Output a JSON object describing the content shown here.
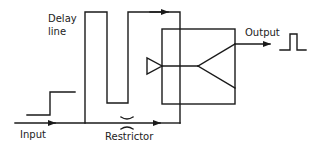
{
  "diagram": {
    "labels": {
      "delay_line_1": "Delay",
      "delay_line_2": "line",
      "input": "Input",
      "restrictor": "Restrictor",
      "output": "Output"
    },
    "components": [
      {
        "id": "input-step",
        "type": "signal-waveform",
        "shape": "step"
      },
      {
        "id": "delay-line",
        "type": "channel"
      },
      {
        "id": "restrictor",
        "type": "restrictor"
      },
      {
        "id": "element-box",
        "type": "fluidic-element"
      },
      {
        "id": "output-pulse",
        "type": "signal-waveform",
        "shape": "pulse"
      }
    ],
    "colors": {
      "stroke": "#1a1a1a",
      "background": "#ffffff"
    }
  }
}
